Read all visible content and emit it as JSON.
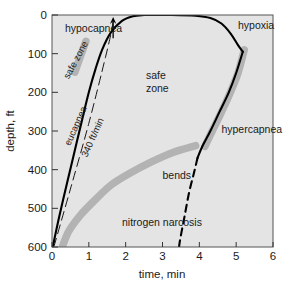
{
  "chart_data": {
    "type": "line",
    "title": "",
    "xlabel": "time, min",
    "ylabel": "depth, ft",
    "xlim": [
      0,
      6
    ],
    "ylim": [
      600,
      0
    ],
    "y_inverted": true,
    "grid": false,
    "legend": "none",
    "plot_bg": "#e4e4e4",
    "band_color": "#b3b3b3",
    "line_color": "#000000",
    "xticks": [
      "0",
      "1",
      "2",
      "3",
      "4",
      "5",
      "6"
    ],
    "xtick_values": [
      0,
      1,
      2,
      3,
      4,
      5,
      6
    ],
    "yticks": [
      "0",
      "100",
      "200",
      "300",
      "400",
      "500",
      "600"
    ],
    "ytick_values": [
      0,
      100,
      200,
      300,
      400,
      500,
      600
    ],
    "series": [
      {
        "name": "eucapnea",
        "style": "solid",
        "comment": "left boundary of safe zone: descent limit curve",
        "points": [
          [
            0.02,
            600
          ],
          [
            0.2,
            520
          ],
          [
            0.42,
            430
          ],
          [
            0.62,
            350
          ],
          [
            0.82,
            270
          ],
          [
            1.0,
            200
          ],
          [
            1.18,
            140
          ],
          [
            1.36,
            90
          ],
          [
            1.6,
            45
          ],
          [
            1.9,
            15
          ],
          [
            2.2,
            3
          ],
          [
            2.5,
            0
          ]
        ]
      },
      {
        "name": "hypoxia",
        "style": "solid",
        "comment": "top-right boundary of safe zone from depth 0 curving down",
        "points": [
          [
            2.5,
            0
          ],
          [
            3.2,
            0
          ],
          [
            3.9,
            2
          ],
          [
            4.3,
            8
          ],
          [
            4.6,
            22
          ],
          [
            4.85,
            48
          ],
          [
            5.05,
            78
          ],
          [
            5.18,
            95
          ]
        ]
      },
      {
        "name": "hypercapnea",
        "style": "solid",
        "comment": "right boundary continuing down from the hypoxia bulge",
        "points": [
          [
            5.18,
            95
          ],
          [
            5.0,
            150
          ],
          [
            4.8,
            200
          ],
          [
            4.55,
            250
          ],
          [
            4.3,
            300
          ],
          [
            4.08,
            340
          ],
          [
            3.95,
            370
          ]
        ]
      },
      {
        "name": "340 ft/min",
        "style": "dashed-thin",
        "comment": "constant descent rate reference line",
        "points": [
          [
            0.05,
            600
          ],
          [
            0.5,
            450
          ],
          [
            1.0,
            280
          ],
          [
            1.45,
            110
          ],
          [
            1.62,
            40
          ],
          [
            1.65,
            20
          ]
        ]
      },
      {
        "name": "hypercapnea-limit-dashed",
        "style": "dashed",
        "comment": "dashed extension of hypercapnea boundary below 370 ft",
        "points": [
          [
            3.95,
            370
          ],
          [
            3.85,
            410
          ],
          [
            3.72,
            460
          ],
          [
            3.6,
            520
          ],
          [
            3.48,
            580
          ],
          [
            3.45,
            600
          ]
        ]
      },
      {
        "name": "bends",
        "style": "thick-gray-band",
        "comment": "decompression sickness threshold band",
        "points": [
          [
            0.28,
            600
          ],
          [
            0.45,
            560
          ],
          [
            0.75,
            520
          ],
          [
            1.15,
            480
          ],
          [
            1.6,
            440
          ],
          [
            2.1,
            410
          ],
          [
            2.7,
            380
          ],
          [
            3.3,
            355
          ],
          [
            3.9,
            338
          ]
        ]
      },
      {
        "name": "safe-zone-marker",
        "style": "thick-gray-band",
        "comment": "short gray bar marking the narrow safe corridor near the left boundary",
        "points": [
          [
            0.62,
            148
          ],
          [
            0.78,
            105
          ],
          [
            0.92,
            68
          ]
        ]
      },
      {
        "name": "hypoxia-hypercapnea-shadow",
        "style": "thick-gray-band",
        "comment": "gray shadow following the right boundary",
        "points": [
          [
            5.22,
            90
          ],
          [
            5.05,
            150
          ],
          [
            4.82,
            205
          ],
          [
            4.58,
            255
          ],
          [
            4.35,
            300
          ],
          [
            4.15,
            340
          ]
        ]
      }
    ],
    "annotations": [
      {
        "name": "hypocapnea",
        "text": "hypocapnea",
        "x": 0.35,
        "y": 45,
        "rotation": 0
      },
      {
        "name": "hypoxia",
        "text": "hypoxia",
        "x": 5.05,
        "y": 35,
        "rotation": 0
      },
      {
        "name": "safe-zone-left",
        "text": "safe zone",
        "x": 0.72,
        "y": 120,
        "rotation": -62
      },
      {
        "name": "safe-zone-center",
        "text": "safe",
        "x": 2.55,
        "y": 165,
        "rotation": 0
      },
      {
        "name": "safe-zone-center-2",
        "text": "zone",
        "x": 2.55,
        "y": 198,
        "rotation": 0
      },
      {
        "name": "eucapnea",
        "text": "eucapnea",
        "x": 0.72,
        "y": 290,
        "rotation": -66
      },
      {
        "name": "rate-340",
        "text": "340 ft/min",
        "x": 1.18,
        "y": 320,
        "rotation": -66
      },
      {
        "name": "hypercapnea",
        "text": "hypercapnea",
        "x": 4.6,
        "y": 305,
        "rotation": 0
      },
      {
        "name": "bends",
        "text": "bends",
        "x": 3.0,
        "y": 425,
        "rotation": 0
      },
      {
        "name": "nitrogen-narcosis",
        "text": "nitrogen narcosis",
        "x": 1.9,
        "y": 545,
        "rotation": 0
      }
    ],
    "arrow": {
      "name": "ascent-arrow",
      "x": 1.66,
      "y_from": 60,
      "y_to": 5
    }
  }
}
